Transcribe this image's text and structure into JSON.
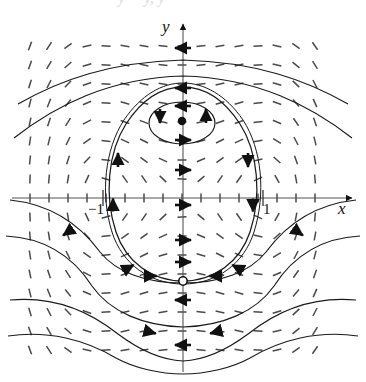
{
  "figure": {
    "kind": "phase-portrait",
    "caption_fragment": "y = y,  y = ",
    "background": "#ffffff",
    "ink": "#1a1a1a",
    "field_color": "#4a4a4a",
    "axis_color": "#555555"
  },
  "axes": {
    "x_axis_label": "x",
    "y_axis_label": "y",
    "x_axis_y_px": 198,
    "y_axis_x_px": 183,
    "x_ticks": [
      {
        "label": "−1",
        "x_px": 103
      },
      {
        "label": "1",
        "x_px": 263
      }
    ],
    "y_ticks": []
  },
  "critical_points": [
    {
      "name": "center",
      "marker": "filled-dot",
      "x_px": 182,
      "y_px": 121,
      "label": ""
    },
    {
      "name": "saddle",
      "marker": "open-circle",
      "x_px": 183,
      "y_px": 281,
      "label": ""
    }
  ],
  "chart_data": {
    "type": "scatter",
    "title": "",
    "xlabel": "x",
    "ylabel": "y",
    "grid": false,
    "legend": null,
    "xlim": [
      -2.3,
      2.3
    ],
    "ylim": [
      -2.1,
      2.4
    ],
    "slope_field": {
      "x_start_px": 30,
      "x_step_px": 19,
      "x_count": 16,
      "y_start_px": 46,
      "y_step_px": 19,
      "y_count": 17,
      "dash_len_px": 9
    },
    "annotations": [
      {
        "text": "−1",
        "x_px": 96,
        "y_px": 212
      },
      {
        "text": "1",
        "x_px": 266,
        "y_px": 212
      },
      {
        "text": "x",
        "x_px": 345,
        "y_px": 208
      },
      {
        "text": "y",
        "x_px": 167,
        "y_px": 30
      }
    ]
  }
}
